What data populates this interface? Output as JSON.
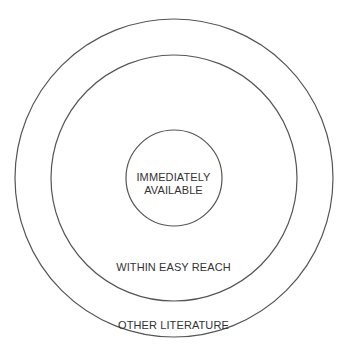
{
  "diagram": {
    "type": "concentric-circles",
    "line_color": "#555555",
    "rings": [
      {
        "id": "inner",
        "label_line1": "IMMEDIATELY",
        "label_line2": "AVAILABLE"
      },
      {
        "id": "middle",
        "label": "WITHIN EASY REACH"
      },
      {
        "id": "outer",
        "label": "OTHER LITERATURE"
      }
    ]
  }
}
